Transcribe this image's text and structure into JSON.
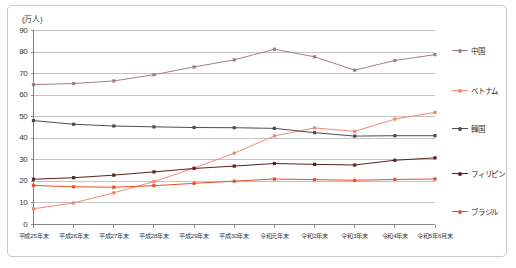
{
  "chart_data": {
    "type": "line",
    "title": "",
    "subtitle": "",
    "xlabel": "",
    "ylabel": "",
    "unit_label": "(万人)",
    "ylim": [
      0,
      90
    ],
    "ytick_step": 10,
    "yticks": [
      "0",
      "10",
      "20",
      "30",
      "40",
      "50",
      "60",
      "70",
      "80",
      "90"
    ],
    "grid": true,
    "grid_axis": "y",
    "legend_position": "right",
    "categories": [
      "平成25年末",
      "平成26年末",
      "平成27年末",
      "平成28年末",
      "平成29年末",
      "平成30年末",
      "令和元年末",
      "令和2年末",
      "令和3年末",
      "令和4年末",
      "令和5年6月末"
    ],
    "series": [
      {
        "name": "中国",
        "color": "#a07f8c",
        "marker": "square",
        "values": [
          64.9,
          65.4,
          66.6,
          69.5,
          73.1,
          76.4,
          81.3,
          77.8,
          71.6,
          76.1,
          78.8
        ]
      },
      {
        "name": "ベトナム",
        "color": "#f08878",
        "marker": "square",
        "values": [
          7.3,
          10.0,
          14.7,
          19.9,
          26.2,
          33.1,
          41.1,
          44.8,
          43.2,
          48.9,
          52.0
        ]
      },
      {
        "name": "韓国",
        "color": "#4d4d4d",
        "marker": "square",
        "values": [
          48.2,
          46.5,
          45.7,
          45.3,
          45.0,
          44.9,
          44.6,
          42.6,
          41.0,
          41.2,
          41.2
        ]
      },
      {
        "name": "フィリピン",
        "color": "#57231f",
        "marker": "square",
        "values": [
          21.0,
          21.7,
          22.9,
          24.4,
          26.0,
          27.1,
          28.3,
          27.9,
          27.6,
          29.8,
          30.9
        ]
      },
      {
        "name": "ブラジル",
        "color": "#e8502a",
        "marker": "square",
        "values": [
          18.1,
          17.5,
          17.3,
          18.0,
          19.1,
          20.1,
          21.1,
          20.8,
          20.5,
          20.9,
          21.1
        ]
      }
    ]
  },
  "axis": {
    "unit": "(万人)"
  },
  "legend": {
    "items": [
      {
        "label": "中国"
      },
      {
        "label": "ベトナム"
      },
      {
        "label": "韓国"
      },
      {
        "label": "フィリピン"
      },
      {
        "label": "ブラジル"
      }
    ]
  }
}
